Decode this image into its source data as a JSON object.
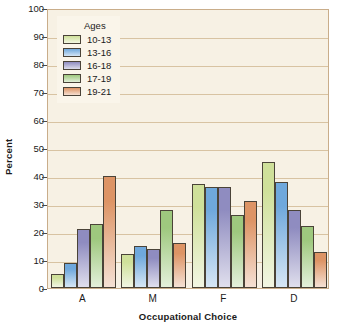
{
  "chart_data": {
    "type": "bar",
    "title": "",
    "xlabel": "Occupational Choice",
    "ylabel": "Percent",
    "categories": [
      "A",
      "M",
      "F",
      "D"
    ],
    "ylim": [
      0,
      100
    ],
    "yticks": [
      100,
      90,
      80,
      70,
      60,
      50,
      40,
      30,
      20,
      10,
      0
    ],
    "grid": true,
    "legend_position": "top-left",
    "legend_title": "Ages",
    "series": [
      {
        "name": "10-13",
        "color": "#cfe09a",
        "values": [
          5,
          12,
          37,
          45
        ]
      },
      {
        "name": "13-16",
        "color": "#6fa8dc",
        "values": [
          9,
          15,
          36,
          38
        ]
      },
      {
        "name": "16-18",
        "color": "#8f8cc0",
        "values": [
          21,
          14,
          36,
          28
        ]
      },
      {
        "name": "17-19",
        "color": "#9ec87e",
        "values": [
          23,
          28,
          26,
          22
        ]
      },
      {
        "name": "19-21",
        "color": "#dd9465",
        "values": [
          40,
          16,
          31,
          13
        ]
      }
    ]
  },
  "colors": {
    "plot_background": "#f7f1e4",
    "gridline": "#d8c3a2",
    "axis": "#4a4a4a",
    "text": "#1a1a1a",
    "legend_background": "#faf5ea",
    "bar_outline": "#4a4338"
  }
}
